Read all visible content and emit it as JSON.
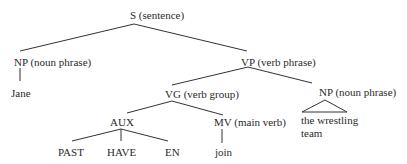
{
  "tree": {
    "title": "Syntax tree of 'Jane has joined the wrestling team'",
    "nodes": {
      "s": {
        "label": "S (sentence)"
      },
      "np1": {
        "label": "NP (noun phrase)"
      },
      "jane": {
        "label": "Jane"
      },
      "vp": {
        "label": "VP (verb phrase)"
      },
      "vg": {
        "label": "VG (verb group)"
      },
      "np2": {
        "label": "NP (noun phrase)"
      },
      "np2_text_line1": {
        "label": "the wrestling"
      },
      "np2_text_line2": {
        "label": "team"
      },
      "aux": {
        "label": "AUX"
      },
      "mv": {
        "label": "MV (main verb)"
      },
      "join": {
        "label": "join"
      },
      "past": {
        "label": "PAST"
      },
      "have": {
        "label": "HAVE"
      },
      "en": {
        "label": "EN"
      }
    },
    "line_color": "#333333"
  }
}
